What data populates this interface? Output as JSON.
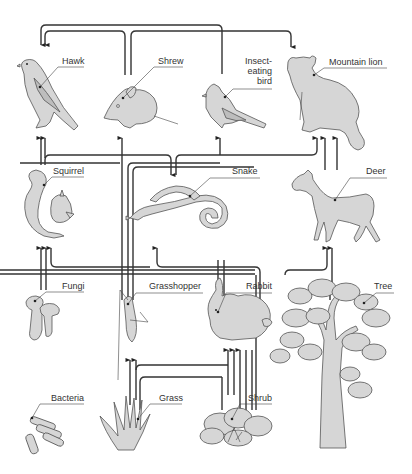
{
  "diagram": {
    "type": "food-web",
    "organisms": [
      {
        "id": "hawk",
        "label": "Hawk",
        "level": "top-predator"
      },
      {
        "id": "shrew",
        "label": "Shrew",
        "level": "predator"
      },
      {
        "id": "insect_eating_bird",
        "label": "Insect-\neating\nbird",
        "label_lines": [
          "Insect-",
          "eating",
          "bird"
        ],
        "level": "predator"
      },
      {
        "id": "mountain_lion",
        "label": "Mountain lion",
        "level": "top-predator"
      },
      {
        "id": "squirrel",
        "label": "Squirrel",
        "level": "herbivore"
      },
      {
        "id": "snake",
        "label": "Snake",
        "level": "predator"
      },
      {
        "id": "deer",
        "label": "Deer",
        "level": "herbivore"
      },
      {
        "id": "fungi",
        "label": "Fungi",
        "level": "decomposer"
      },
      {
        "id": "grasshopper",
        "label": "Grasshopper",
        "level": "herbivore"
      },
      {
        "id": "rabbit",
        "label": "Rabbit",
        "level": "herbivore"
      },
      {
        "id": "tree",
        "label": "Tree",
        "level": "producer"
      },
      {
        "id": "bacteria",
        "label": "Bacteria",
        "level": "decomposer"
      },
      {
        "id": "grass",
        "label": "Grass",
        "level": "producer"
      },
      {
        "id": "shrub",
        "label": "Shrub",
        "level": "producer"
      }
    ],
    "edges": [
      {
        "from": "snake",
        "to": "hawk"
      },
      {
        "from": "shrew",
        "to": "hawk"
      },
      {
        "from": "squirrel",
        "to": "hawk"
      },
      {
        "from": "snake",
        "to": "hawk"
      },
      {
        "from": "shrew",
        "to": "mountain_lion"
      },
      {
        "from": "grasshopper",
        "to": "shrew"
      },
      {
        "from": "grasshopper",
        "to": "insect_eating_bird"
      },
      {
        "from": "rabbit",
        "to": "snake"
      },
      {
        "from": "shrew",
        "to": "snake"
      },
      {
        "from": "insect_eating_bird",
        "to": "snake"
      },
      {
        "from": "snake",
        "to": "mountain_lion"
      },
      {
        "from": "deer",
        "to": "mountain_lion"
      },
      {
        "from": "rabbit",
        "to": "mountain_lion"
      },
      {
        "from": "fungi",
        "to": "squirrel"
      },
      {
        "from": "tree",
        "to": "squirrel"
      },
      {
        "from": "grass",
        "to": "squirrel"
      },
      {
        "from": "tree",
        "to": "deer"
      },
      {
        "from": "shrub",
        "to": "deer"
      },
      {
        "from": "grass",
        "to": "grasshopper"
      },
      {
        "from": "grass",
        "to": "rabbit"
      },
      {
        "from": "shrub",
        "to": "rabbit"
      }
    ]
  }
}
